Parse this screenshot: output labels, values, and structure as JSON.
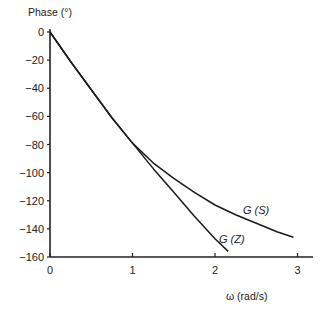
{
  "chart_data": {
    "type": "line",
    "title": "",
    "xlabel": "ω (rad/s)",
    "ylabel": "Phase (°)",
    "xlim": [
      0,
      3.2
    ],
    "ylim": [
      -160,
      0
    ],
    "x_ticks": [
      "0",
      "1",
      "2",
      "3"
    ],
    "y_ticks": [
      "0",
      "−20",
      "−40",
      "−60",
      "−80",
      "−100",
      "−120",
      "−140",
      "−160"
    ],
    "grid": false,
    "legend": "inline labels",
    "series": [
      {
        "name": "G (S)",
        "x": [
          0,
          0.25,
          0.5,
          0.75,
          1.0,
          1.25,
          1.5,
          1.75,
          2.0,
          2.25,
          2.5,
          2.75,
          2.95
        ],
        "values": [
          0,
          -21,
          -41,
          -61,
          -79,
          -93,
          -104,
          -114,
          -123,
          -130,
          -136,
          -142,
          -146
        ]
      },
      {
        "name": "G (Z)",
        "x": [
          0,
          0.25,
          0.5,
          0.75,
          1.0,
          1.25,
          1.5,
          1.75,
          2.0,
          2.16
        ],
        "values": [
          0,
          -21,
          -41,
          -61,
          -79,
          -97,
          -114,
          -131,
          -147,
          -156
        ]
      }
    ]
  },
  "labels": {
    "y_axis": "Phase (°)",
    "x_axis": "ω (rad/s)",
    "series_s": "G (S)",
    "series_z": "G (Z)"
  }
}
